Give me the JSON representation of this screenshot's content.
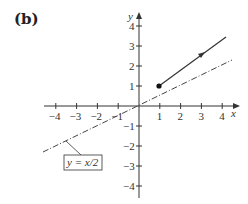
{
  "panel_label": "(b)",
  "chart_data": {
    "type": "line",
    "title": "",
    "xlabel": "x",
    "ylabel": "y",
    "xlim": [
      -4,
      4
    ],
    "ylim": [
      -4,
      4
    ],
    "x_ticks": [
      "-4",
      "-3",
      "-2",
      "-1",
      "1",
      "2",
      "3",
      "4"
    ],
    "y_ticks": [
      "4",
      "3",
      "2",
      "1",
      "-1",
      "-2",
      "-3",
      "-4"
    ],
    "grid": false,
    "series": [
      {
        "name": "ray",
        "style": "solid",
        "start_point": [
          1,
          1
        ],
        "start_marker": "filled-dot",
        "direction_arrow_at": [
          3,
          2.6
        ],
        "end_point": [
          4.2,
          3.4
        ],
        "x": [
          1,
          4.2
        ],
        "y": [
          1,
          3.4
        ]
      },
      {
        "name": "y = x/2",
        "style": "dash-dot",
        "x": [
          -4.4,
          4.4
        ],
        "y": [
          -2.2,
          2.2
        ]
      }
    ],
    "annotations": [
      {
        "text": "y = x/2",
        "boxed": true,
        "points_to": [
          -3.4,
          -1.7
        ]
      }
    ]
  }
}
